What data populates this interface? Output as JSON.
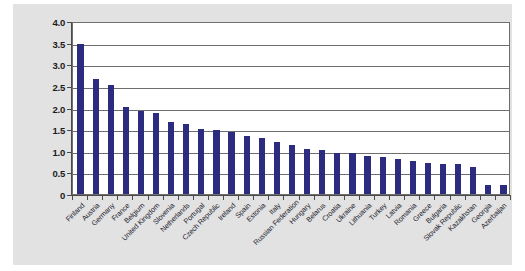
{
  "chart_data": {
    "type": "bar",
    "title": "",
    "subtitle": "",
    "xlabel": "",
    "ylabel": "",
    "ylim": [
      0,
      4.0
    ],
    "grid": true,
    "legend": null,
    "bar_color": "#2b2b80",
    "plot_background": "#ffffff",
    "figure_background": "#e2e2e2",
    "ytick_labels": [
      "4.0",
      "3.5",
      "3.0",
      "2.5",
      "2.0",
      "1.5",
      "1.0",
      "0.5",
      "0"
    ],
    "ytick_values": [
      4.0,
      3.5,
      3.0,
      2.5,
      2.0,
      1.5,
      1.0,
      0.5,
      0
    ],
    "categories": [
      "Finland",
      "Austria",
      "Germany",
      "France",
      "Belgium",
      "United Kingdom",
      "Slovenia",
      "Netherlands",
      "Portugal",
      "Czech Republic",
      "Ireland",
      "Spain",
      "Estonia",
      "Italy",
      "Russian Federation",
      "Hungary",
      "Belarus",
      "Croatia",
      "Ukraine",
      "Lithuania",
      "Turkey",
      "Latvia",
      "Romania",
      "Greece",
      "Bulgaria",
      "Slovak Republic",
      "Kazakhstan",
      "Georgia",
      "Azerbaijan"
    ],
    "values": [
      3.47,
      2.65,
      2.53,
      2.01,
      1.92,
      1.88,
      1.66,
      1.63,
      1.5,
      1.48,
      1.44,
      1.35,
      1.3,
      1.2,
      1.13,
      1.04,
      1.02,
      0.95,
      0.95,
      0.88,
      0.85,
      0.8,
      0.76,
      0.71,
      0.7,
      0.7,
      0.62,
      0.22,
      0.2
    ]
  }
}
